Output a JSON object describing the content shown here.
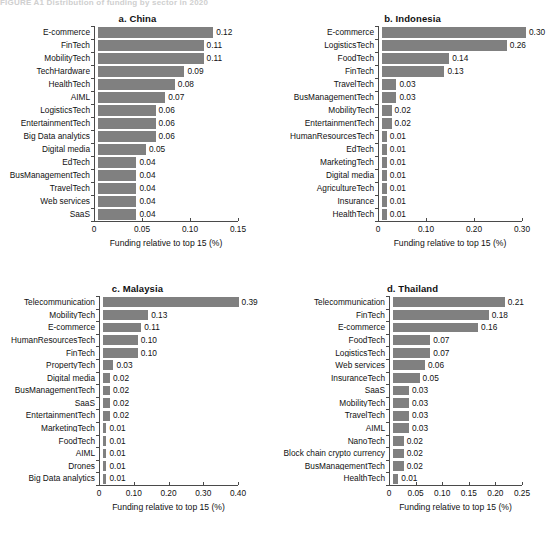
{
  "figure": {
    "header_text": "FIGURE A1   Distribution of funding by sector in 2020",
    "bar_color": "#808080",
    "axis_color": "#4a4a4a"
  },
  "chart_data": [
    {
      "type": "bar",
      "title": "a. China",
      "orientation": "horizontal",
      "xlabel": "Funding relative to top 15 (%)",
      "ylabel": "",
      "xlim": [
        0,
        0.15
      ],
      "xticks": [
        "0",
        "0.05",
        "0.10",
        "0.15"
      ],
      "xtick_values": [
        0,
        0.05,
        0.1,
        0.15
      ],
      "grid": false,
      "legend": "none",
      "categories": [
        "E-commerce",
        "FinTech",
        "MobilityTech",
        "TechHardware",
        "HealthTech",
        "AIML",
        "LogisticsTech",
        "EntertainmentTech",
        "Big Data analytics",
        "Digital media",
        "EdTech",
        "BusManagementTech",
        "TravelTech",
        "Web services",
        "SaaS"
      ],
      "values": [
        0.12,
        0.11,
        0.11,
        0.09,
        0.08,
        0.07,
        0.06,
        0.06,
        0.06,
        0.05,
        0.04,
        0.04,
        0.04,
        0.04,
        0.04
      ],
      "labels": [
        "0.12",
        "0.11",
        "0.11",
        "0.09",
        "0.08",
        "0.07",
        "0.06",
        "0.06",
        "0.06",
        "0.05",
        "0.04",
        "0.04",
        "0.04",
        "0.04",
        "0.04"
      ]
    },
    {
      "type": "bar",
      "title": "b. Indonesia",
      "orientation": "horizontal",
      "xlabel": "Funding relative to top 15 (%)",
      "ylabel": "",
      "xlim": [
        0,
        0.3
      ],
      "xticks": [
        "0",
        "0.10",
        "0.20",
        "0.30"
      ],
      "xtick_values": [
        0,
        0.1,
        0.2,
        0.3
      ],
      "grid": false,
      "legend": "none",
      "categories": [
        "E-commerce",
        "LogisticsTech",
        "FoodTech",
        "FinTech",
        "TravelTech",
        "BusManagementTech",
        "MobilityTech",
        "EntertainmentTech",
        "HumanResourcesTech",
        "EdTech",
        "MarketingTech",
        "Digital media",
        "AgricultureTech",
        "Insurance",
        "HealthTech"
      ],
      "values": [
        0.3,
        0.26,
        0.14,
        0.13,
        0.03,
        0.03,
        0.02,
        0.02,
        0.01,
        0.01,
        0.01,
        0.01,
        0.01,
        0.01,
        0.01
      ],
      "labels": [
        "0.30",
        "0.26",
        "0.14",
        "0.13",
        "0.03",
        "0.03",
        "0.02",
        "0.02",
        "0.01",
        "0.01",
        "0.01",
        "0.01",
        "0.01",
        "0.01",
        "0.01"
      ]
    },
    {
      "type": "bar",
      "title": "c. Malaysia",
      "orientation": "horizontal",
      "xlabel": "Funding relative to top 15 (%)",
      "ylabel": "",
      "xlim": [
        0,
        0.4
      ],
      "xticks": [
        "0",
        "0.10",
        "0.20",
        "0.30",
        "0.40"
      ],
      "xtick_values": [
        0,
        0.1,
        0.2,
        0.3,
        0.4
      ],
      "grid": false,
      "legend": "none",
      "categories": [
        "Telecommunication",
        "MobilityTech",
        "E-commerce",
        "HumanResourcesTech",
        "FinTech",
        "PropertyTech",
        "Digital media",
        "BusManagementTech",
        "SaaS",
        "EntertainmentTech",
        "MarketingTech",
        "FoodTech",
        "AIML",
        "Drones",
        "Big Data analytics"
      ],
      "values": [
        0.39,
        0.13,
        0.11,
        0.1,
        0.1,
        0.03,
        0.02,
        0.02,
        0.02,
        0.02,
        0.01,
        0.01,
        0.01,
        0.01,
        0.01
      ],
      "labels": [
        "0.39",
        "0.13",
        "0.11",
        "0.10",
        "0.10",
        "0.03",
        "0.02",
        "0.02",
        "0.02",
        "0.02",
        "0.01",
        "0.01",
        "0.01",
        "0.01",
        "0.01"
      ]
    },
    {
      "type": "bar",
      "title": "d. Thailand",
      "orientation": "horizontal",
      "xlabel": "Funding relative to top 15 (%)",
      "ylabel": "",
      "xlim": [
        0,
        0.25
      ],
      "xticks": [
        "0",
        "0.05",
        "0.10",
        "0.15",
        "0.20",
        "0.25"
      ],
      "xtick_values": [
        0,
        0.05,
        0.1,
        0.15,
        0.2,
        0.25
      ],
      "grid": false,
      "legend": "none",
      "categories": [
        "Telecommunication",
        "FinTech",
        "E-commerce",
        "FoodTech",
        "LogisticsTech",
        "Web services",
        "InsuranceTech",
        "SaaS",
        "MobilityTech",
        "TravelTech",
        "AIML",
        "NanoTech",
        "Block chain crypto currency",
        "BusManagementTech",
        "HealthTech"
      ],
      "values": [
        0.21,
        0.18,
        0.16,
        0.07,
        0.07,
        0.06,
        0.05,
        0.03,
        0.03,
        0.03,
        0.03,
        0.02,
        0.02,
        0.02,
        0.01
      ],
      "labels": [
        "0.21",
        "0.18",
        "0.16",
        "0.07",
        "0.07",
        "0.06",
        "0.05",
        "0.03",
        "0.03",
        "0.03",
        "0.03",
        "0.02",
        "0.02",
        "0.02",
        "0.01"
      ]
    }
  ]
}
